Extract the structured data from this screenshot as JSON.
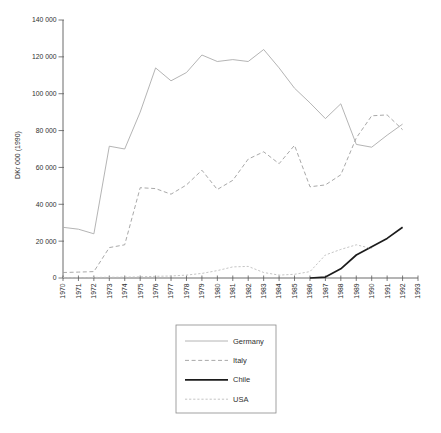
{
  "chart_data": {
    "type": "line",
    "title": "",
    "ylabel": "DKr 000 (1990)",
    "xlabel": "",
    "ylim": [
      0,
      140000
    ],
    "y_tick_step": 20000,
    "grid": false,
    "legend_position": "below-center",
    "x": [
      1970,
      1971,
      1972,
      1973,
      1974,
      1975,
      1976,
      1977,
      1978,
      1979,
      1980,
      1981,
      1982,
      1983,
      1984,
      1985,
      1986,
      1987,
      1988,
      1989,
      1990,
      1991,
      1992,
      1993
    ],
    "x_tick_labels": [
      "1970",
      "1971",
      "1972",
      "1973",
      "1974",
      "1975",
      "1976",
      "1977",
      "1978",
      "1979",
      "1980",
      "1981",
      "1982",
      "1983",
      "1984",
      "1985",
      "1986",
      "1987",
      "1988",
      "1989",
      "1990",
      "1991",
      "1992",
      "1993"
    ],
    "y_tick_labels": [
      "0",
      "20 000",
      "40 000",
      "60 000",
      "80 000",
      "100 000",
      "120 000",
      "140 000"
    ],
    "series": [
      {
        "name": "Germany",
        "color": "#ababab",
        "style": "solid",
        "stroke_width": 0.9,
        "values": [
          27500,
          26500,
          24000,
          71500,
          70000,
          90000,
          114000,
          107000,
          111500,
          121000,
          117500,
          118500,
          117500,
          124000,
          114000,
          103000,
          95000,
          86500,
          94500,
          72500,
          71000,
          77500,
          83500,
          null
        ]
      },
      {
        "name": "Italy",
        "color": "#9e9e9e",
        "style": "dashed",
        "stroke_width": 0.9,
        "values": [
          3000,
          3200,
          3500,
          16500,
          18000,
          49000,
          48500,
          45500,
          50500,
          58500,
          48000,
          53000,
          64500,
          68500,
          62000,
          72000,
          49500,
          50500,
          56000,
          76000,
          88000,
          88500,
          80500,
          null
        ]
      },
      {
        "name": "Chile",
        "color": "#1c1c1c",
        "style": "solid",
        "stroke_width": 1.7,
        "values": [
          null,
          null,
          null,
          null,
          null,
          null,
          null,
          null,
          null,
          null,
          null,
          null,
          null,
          null,
          null,
          null,
          0,
          500,
          5000,
          12500,
          17000,
          21500,
          27500,
          null
        ]
      },
      {
        "name": "USA",
        "color": "#bdbdbd",
        "style": "dash-dot",
        "stroke_width": 0.9,
        "values": [
          200,
          200,
          300,
          400,
          500,
          600,
          900,
          1100,
          1600,
          2500,
          4000,
          6000,
          6300,
          3000,
          1600,
          2000,
          3500,
          12500,
          15500,
          18000,
          16000,
          null,
          null,
          null
        ]
      }
    ]
  },
  "colors": {
    "axis": "#5a5a5a",
    "text": "#2f2f2f",
    "legend_border": "#8a8a8a",
    "background": "#ffffff"
  }
}
